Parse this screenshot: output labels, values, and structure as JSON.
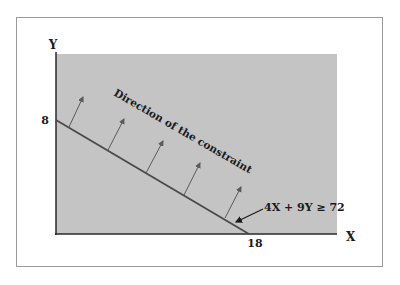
{
  "diagram": {
    "axes": {
      "x_label": "X",
      "y_label": "Y",
      "y_intercept_label": "8",
      "x_intercept_label": "18"
    },
    "constraint": {
      "label": "4X + 9Y ≥ 72",
      "a": 4,
      "b": 9,
      "rhs": 72,
      "x_intercept": 18,
      "y_intercept": 8
    },
    "direction_label": "Direction of the constraint",
    "colors": {
      "shaded_region": "#c4c4c4",
      "line": "#4a4a4a",
      "arrows": "#5a5a5a",
      "frame": "#9a9a9a"
    },
    "arrow_count": 5
  }
}
